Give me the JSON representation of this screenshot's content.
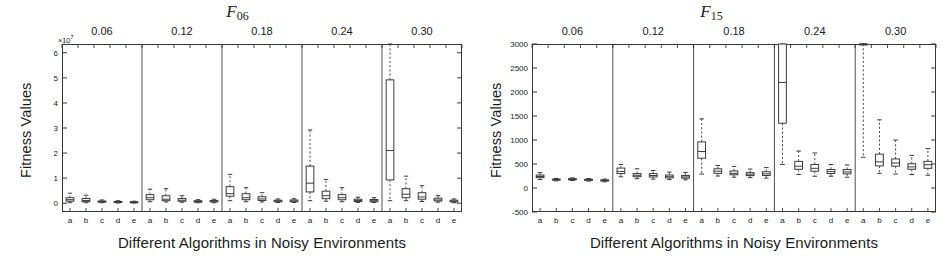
{
  "figure": {
    "panels": [
      {
        "id": "F06",
        "title_base": "F",
        "title_sub": "06",
        "ylabel": "Fitness Values",
        "xlabel": "Different Algorithms in Noisy Environments",
        "exponent_label": "×10",
        "exponent_sup": "7",
        "ytick_labels": [
          "0",
          "1",
          "2",
          "3",
          "4",
          "5",
          "6"
        ],
        "xtop_labels": [
          "0.06",
          "0.12",
          "0.18",
          "0.24",
          "0.30"
        ],
        "xbot_labels": [
          "a",
          "b",
          "c",
          "d",
          "e",
          "a",
          "b",
          "c",
          "d",
          "e",
          "a",
          "b",
          "c",
          "d",
          "e",
          "a",
          "b",
          "c",
          "d",
          "e",
          "a",
          "b",
          "c",
          "d",
          "e"
        ]
      },
      {
        "id": "F15",
        "title_base": "F",
        "title_sub": "15",
        "ylabel": "Fitness Values",
        "xlabel": "Different Algorithms in Noisy Environments",
        "exponent_label": "",
        "exponent_sup": "",
        "ytick_labels": [
          "-500",
          "0",
          "500",
          "1000",
          "1500",
          "2000",
          "2500",
          "3000"
        ],
        "xtop_labels": [
          "0.06",
          "0.12",
          "0.18",
          "0.24",
          "0.30"
        ],
        "xbot_labels": [
          "a",
          "b",
          "c",
          "d",
          "e",
          "a",
          "b",
          "c",
          "d",
          "e",
          "a",
          "b",
          "c",
          "d",
          "e",
          "a",
          "b",
          "c",
          "d",
          "e",
          "a",
          "b",
          "c",
          "d",
          "e"
        ]
      }
    ]
  },
  "chart_data": [
    {
      "type": "box",
      "id": "F06",
      "title": "F06",
      "xlabel": "Different Algorithms in Noisy Environments",
      "ylabel": "Fitness Values",
      "y_multiplier": "x10^7",
      "ylim": [
        -0.35,
        6.35
      ],
      "yticks": [
        0,
        1,
        2,
        3,
        4,
        5,
        6
      ],
      "grid": false,
      "legend": null,
      "group_labels": [
        "0.06",
        "0.12",
        "0.18",
        "0.24",
        "0.30"
      ],
      "category_labels": [
        "a",
        "b",
        "c",
        "d",
        "e"
      ],
      "groups": [
        {
          "noise": "0.06",
          "boxes": [
            {
              "cat": "a",
              "whislo": 0.02,
              "q1": 0.08,
              "med": 0.14,
              "q3": 0.22,
              "whishi": 0.4
            },
            {
              "cat": "b",
              "whislo": 0.02,
              "q1": 0.06,
              "med": 0.11,
              "q3": 0.19,
              "whishi": 0.32
            },
            {
              "cat": "c",
              "whislo": 0.02,
              "q1": 0.04,
              "med": 0.06,
              "q3": 0.09,
              "whishi": 0.13
            },
            {
              "cat": "d",
              "whislo": 0.01,
              "q1": 0.03,
              "med": 0.05,
              "q3": 0.07,
              "whishi": 0.1
            },
            {
              "cat": "e",
              "whislo": 0.01,
              "q1": 0.02,
              "med": 0.04,
              "q3": 0.06,
              "whishi": 0.08
            }
          ]
        },
        {
          "noise": "0.12",
          "boxes": [
            {
              "cat": "a",
              "whislo": 0.06,
              "q1": 0.14,
              "med": 0.22,
              "q3": 0.34,
              "whishi": 0.56
            },
            {
              "cat": "b",
              "whislo": 0.05,
              "q1": 0.1,
              "med": 0.16,
              "q3": 0.3,
              "whishi": 0.58
            },
            {
              "cat": "c",
              "whislo": 0.04,
              "q1": 0.08,
              "med": 0.12,
              "q3": 0.19,
              "whishi": 0.3
            },
            {
              "cat": "d",
              "whislo": 0.02,
              "q1": 0.04,
              "med": 0.07,
              "q3": 0.1,
              "whishi": 0.14
            },
            {
              "cat": "e",
              "whislo": 0.02,
              "q1": 0.05,
              "med": 0.08,
              "q3": 0.11,
              "whishi": 0.16
            }
          ]
        },
        {
          "noise": "0.18",
          "boxes": [
            {
              "cat": "a",
              "whislo": 0.1,
              "q1": 0.28,
              "med": 0.38,
              "q3": 0.66,
              "whishi": 1.15
            },
            {
              "cat": "b",
              "whislo": 0.06,
              "q1": 0.14,
              "med": 0.22,
              "q3": 0.38,
              "whishi": 0.62
            },
            {
              "cat": "c",
              "whislo": 0.05,
              "q1": 0.11,
              "med": 0.17,
              "q3": 0.26,
              "whishi": 0.42
            },
            {
              "cat": "d",
              "whislo": 0.03,
              "q1": 0.06,
              "med": 0.09,
              "q3": 0.12,
              "whishi": 0.17
            },
            {
              "cat": "e",
              "whislo": 0.03,
              "q1": 0.06,
              "med": 0.09,
              "q3": 0.13,
              "whishi": 0.18
            }
          ]
        },
        {
          "noise": "0.24",
          "boxes": [
            {
              "cat": "a",
              "whislo": 0.1,
              "q1": 0.45,
              "med": 0.8,
              "q3": 1.48,
              "whishi": 2.92
            },
            {
              "cat": "b",
              "whislo": 0.08,
              "q1": 0.18,
              "med": 0.3,
              "q3": 0.48,
              "whishi": 0.95
            },
            {
              "cat": "c",
              "whislo": 0.06,
              "q1": 0.14,
              "med": 0.22,
              "q3": 0.34,
              "whishi": 0.62
            },
            {
              "cat": "d",
              "whislo": 0.03,
              "q1": 0.07,
              "med": 0.11,
              "q3": 0.16,
              "whishi": 0.24
            },
            {
              "cat": "e",
              "whislo": 0.03,
              "q1": 0.06,
              "med": 0.1,
              "q3": 0.15,
              "whishi": 0.22
            }
          ]
        },
        {
          "noise": "0.30",
          "boxes": [
            {
              "cat": "a",
              "whislo": 0.1,
              "q1": 0.93,
              "med": 2.1,
              "q3": 4.92,
              "whishi": 6.35
            },
            {
              "cat": "b",
              "whislo": 0.1,
              "q1": 0.22,
              "med": 0.36,
              "q3": 0.58,
              "whishi": 1.08
            },
            {
              "cat": "c",
              "whislo": 0.07,
              "q1": 0.16,
              "med": 0.25,
              "q3": 0.42,
              "whishi": 0.7
            },
            {
              "cat": "d",
              "whislo": 0.04,
              "q1": 0.09,
              "med": 0.13,
              "q3": 0.2,
              "whishi": 0.3
            },
            {
              "cat": "e",
              "whislo": 0.02,
              "q1": 0.05,
              "med": 0.08,
              "q3": 0.12,
              "whishi": 0.17
            }
          ]
        }
      ]
    },
    {
      "type": "box",
      "id": "F15",
      "title": "F15",
      "xlabel": "Different Algorithms in Noisy Environments",
      "ylabel": "Fitness Values",
      "y_multiplier": "",
      "ylim": [
        -500,
        3000
      ],
      "yticks": [
        -500,
        0,
        500,
        1000,
        1500,
        2000,
        2500,
        3000
      ],
      "grid": false,
      "legend": null,
      "group_labels": [
        "0.06",
        "0.12",
        "0.18",
        "0.24",
        "0.30"
      ],
      "category_labels": [
        "a",
        "b",
        "c",
        "d",
        "e"
      ],
      "groups": [
        {
          "noise": "0.06",
          "boxes": [
            {
              "cat": "a",
              "whislo": 175,
              "q1": 215,
              "med": 240,
              "q3": 270,
              "whishi": 320
            },
            {
              "cat": "b",
              "whislo": 150,
              "q1": 165,
              "med": 175,
              "q3": 185,
              "whishi": 200
            },
            {
              "cat": "c",
              "whislo": 155,
              "q1": 170,
              "med": 180,
              "q3": 195,
              "whishi": 210
            },
            {
              "cat": "d",
              "whislo": 145,
              "q1": 160,
              "med": 170,
              "q3": 182,
              "whishi": 198
            },
            {
              "cat": "e",
              "whislo": 130,
              "q1": 145,
              "med": 158,
              "q3": 170,
              "whishi": 185
            }
          ]
        },
        {
          "noise": "0.12",
          "boxes": [
            {
              "cat": "a",
              "whislo": 235,
              "q1": 300,
              "med": 345,
              "q3": 415,
              "whishi": 490
            },
            {
              "cat": "b",
              "whislo": 195,
              "q1": 235,
              "med": 265,
              "q3": 300,
              "whishi": 400
            },
            {
              "cat": "c",
              "whislo": 185,
              "q1": 230,
              "med": 260,
              "q3": 300,
              "whishi": 365
            },
            {
              "cat": "d",
              "whislo": 175,
              "q1": 210,
              "med": 235,
              "q3": 270,
              "whishi": 330
            },
            {
              "cat": "e",
              "whislo": 170,
              "q1": 205,
              "med": 230,
              "q3": 262,
              "whishi": 325
            }
          ]
        },
        {
          "noise": "0.18",
          "boxes": [
            {
              "cat": "a",
              "whislo": 290,
              "q1": 620,
              "med": 760,
              "q3": 960,
              "whishi": 1440
            },
            {
              "cat": "b",
              "whislo": 250,
              "q1": 305,
              "med": 350,
              "q3": 400,
              "whishi": 470
            },
            {
              "cat": "c",
              "whislo": 225,
              "q1": 275,
              "med": 305,
              "q3": 355,
              "whishi": 450
            },
            {
              "cat": "d",
              "whislo": 215,
              "q1": 258,
              "med": 288,
              "q3": 320,
              "whishi": 395
            },
            {
              "cat": "e",
              "whislo": 205,
              "q1": 260,
              "med": 295,
              "q3": 340,
              "whishi": 425
            }
          ]
        },
        {
          "noise": "0.24",
          "boxes": [
            {
              "cat": "a",
              "whislo": 490,
              "q1": 1350,
              "med": 2200,
              "q3": 3000,
              "whishi": 3000
            },
            {
              "cat": "b",
              "whislo": 280,
              "q1": 390,
              "med": 455,
              "q3": 555,
              "whishi": 770
            },
            {
              "cat": "c",
              "whislo": 245,
              "q1": 350,
              "med": 410,
              "q3": 490,
              "whishi": 730
            },
            {
              "cat": "d",
              "whislo": 245,
              "q1": 300,
              "med": 340,
              "q3": 385,
              "whishi": 490
            },
            {
              "cat": "e",
              "whislo": 225,
              "q1": 295,
              "med": 335,
              "q3": 385,
              "whishi": 480
            }
          ]
        },
        {
          "noise": "0.30",
          "boxes": [
            {
              "cat": "a",
              "whislo": 640,
              "q1": 3000,
              "med": 3000,
              "q3": 3000,
              "whishi": 3000
            },
            {
              "cat": "b",
              "whislo": 305,
              "q1": 460,
              "med": 545,
              "q3": 705,
              "whishi": 1420
            },
            {
              "cat": "c",
              "whislo": 290,
              "q1": 455,
              "med": 520,
              "q3": 605,
              "whishi": 1000
            },
            {
              "cat": "d",
              "whislo": 280,
              "q1": 390,
              "med": 440,
              "q3": 505,
              "whishi": 680
            },
            {
              "cat": "e",
              "whislo": 265,
              "q1": 410,
              "med": 485,
              "q3": 555,
              "whishi": 820
            }
          ]
        }
      ]
    }
  ]
}
